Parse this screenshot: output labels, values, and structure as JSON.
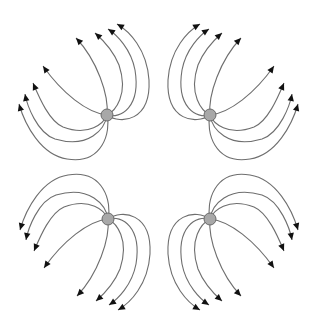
{
  "diagram": {
    "colors": {
      "background": "#ffffff",
      "line": "#6e6e6e",
      "node_fill": "#a8a8a8",
      "node_stroke": "#6a6a6a",
      "arrowhead": "#111111"
    },
    "nodes": [
      {
        "id": "top-left",
        "cx": 107,
        "cy": 115,
        "r": 6,
        "direction": "up-left"
      },
      {
        "id": "top-right",
        "cx": 210,
        "cy": 115,
        "r": 6,
        "direction": "up-right"
      },
      {
        "id": "bottom-left",
        "cx": 108,
        "cy": 219,
        "r": 6,
        "direction": "down-left"
      },
      {
        "id": "bottom-right",
        "cx": 210,
        "cy": 219,
        "r": 6,
        "direction": "down-right"
      }
    ],
    "lines_per_node": 8
  }
}
